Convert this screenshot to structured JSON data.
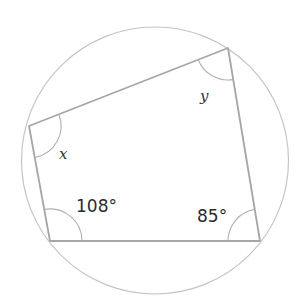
{
  "figure": {
    "type": "cyclic-quadrilateral",
    "circle": {
      "cx": 155,
      "cy": 160,
      "r": 134,
      "color": "#c4c4c4"
    },
    "vertices": {
      "top_left": {
        "x": 29,
        "y": 126
      },
      "top_right": {
        "x": 228,
        "y": 48
      },
      "bottom_right": {
        "x": 260,
        "y": 241
      },
      "bottom_left": {
        "x": 50,
        "y": 241
      }
    },
    "line_color": "#a6a6a6",
    "angles": {
      "top_left": {
        "label": "x",
        "kind": "unknown"
      },
      "top_right": {
        "label": "y",
        "kind": "unknown"
      },
      "bottom_left": {
        "label": "108°",
        "value": 108
      },
      "bottom_right": {
        "label": "85°",
        "value": 85
      }
    }
  }
}
